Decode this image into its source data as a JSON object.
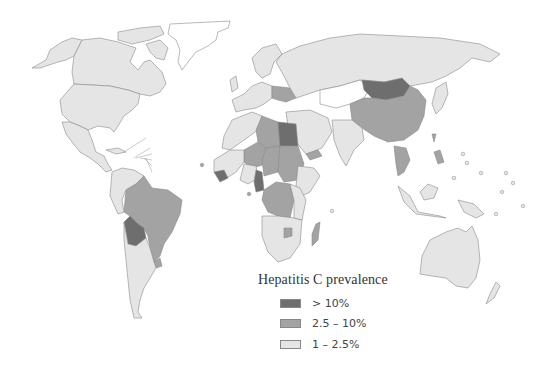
{
  "map": {
    "title": "Hepatitis C prevalence",
    "projection": "world",
    "colors": {
      "high": "#6e6e6e",
      "medium": "#a3a3a3",
      "low": "#e5e5e5",
      "no_data": "#ffffff",
      "border": "#8a8a8a"
    },
    "regions": [
      {
        "name": "Mongolia",
        "category": "> 10%"
      },
      {
        "name": "Egypt",
        "category": "> 10%"
      },
      {
        "name": "Bolivia",
        "category": "> 10%"
      },
      {
        "name": "Guinea",
        "category": "> 10%"
      },
      {
        "name": "Cameroon",
        "category": "> 10%"
      },
      {
        "name": "China",
        "category": "2.5 – 10%"
      },
      {
        "name": "Brazil",
        "category": "2.5 – 10%"
      },
      {
        "name": "Libya",
        "category": "2.5 – 10%"
      },
      {
        "name": "Chad",
        "category": "2.5 – 10%"
      },
      {
        "name": "Sudan",
        "category": "2.5 – 10%"
      },
      {
        "name": "DR Congo",
        "category": "2.5 – 10%"
      },
      {
        "name": "Niger",
        "category": "2.5 – 10%"
      },
      {
        "name": "Madagascar",
        "category": "2.5 – 10%"
      },
      {
        "name": "Zimbabwe",
        "category": "2.5 – 10%"
      },
      {
        "name": "Yemen",
        "category": "2.5 – 10%"
      },
      {
        "name": "Thailand",
        "category": "2.5 – 10%"
      },
      {
        "name": "Vietnam",
        "category": "2.5 – 10%"
      },
      {
        "name": "Philippines",
        "category": "2.5 – 10%"
      },
      {
        "name": "Taiwan",
        "category": "2.5 – 10%"
      },
      {
        "name": "Romania",
        "category": "2.5 – 10%"
      },
      {
        "name": "Ukraine",
        "category": "2.5 – 10%"
      },
      {
        "name": "Uruguay",
        "category": "2.5 – 10%"
      },
      {
        "name": "United States",
        "category": "1 – 2.5%"
      },
      {
        "name": "Canada",
        "category": "1 – 2.5%"
      },
      {
        "name": "Russia",
        "category": "1 – 2.5%"
      },
      {
        "name": "Australia",
        "category": "1 – 2.5%"
      },
      {
        "name": "India",
        "category": "1 – 2.5%"
      },
      {
        "name": "Argentina",
        "category": "1 – 2.5%"
      },
      {
        "name": "Mexico",
        "category": "1 – 2.5%"
      }
    ]
  },
  "legend": {
    "title": "Hepatitis C prevalence",
    "items": [
      {
        "label": "> 10%",
        "color": "#6e6e6e"
      },
      {
        "label": "2.5 – 10%",
        "color": "#a3a3a3"
      },
      {
        "label": "1 – 2.5%",
        "color": "#e5e5e5"
      }
    ]
  }
}
